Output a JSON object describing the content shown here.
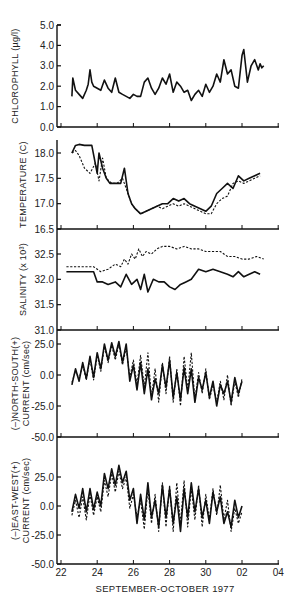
{
  "chart_data": {
    "type": "line",
    "xlabel": "SEPTEMBER-OCTOBER 1977",
    "x_tick_labels": [
      "22",
      "24",
      "26",
      "28",
      "30",
      "02",
      "04"
    ],
    "x_range_days": [
      0,
      12
    ],
    "panels": [
      {
        "id": "chlorophyll",
        "ylabel": "CHLOROPHYLL (µg/l)",
        "ylim": [
          0.0,
          5.0
        ],
        "y_ticks": [
          "5.0",
          "4.0",
          "3.0",
          "2.0",
          "1.0",
          "0.0"
        ],
        "series": [
          {
            "name": "chlorophyll",
            "style": "solid",
            "x": [
              0.6,
              0.65,
              0.8,
              1.0,
              1.2,
              1.4,
              1.5,
              1.6,
              1.7,
              1.8,
              2.0,
              2.2,
              2.4,
              2.6,
              2.8,
              3.0,
              3.2,
              3.4,
              3.6,
              3.8,
              4.0,
              4.2,
              4.4,
              4.6,
              4.8,
              5.0,
              5.2,
              5.4,
              5.6,
              5.8,
              6.0,
              6.2,
              6.4,
              6.6,
              6.8,
              7.0,
              7.2,
              7.4,
              7.6,
              7.8,
              8.0,
              8.2,
              8.4,
              8.6,
              8.8,
              9.0,
              9.2,
              9.4,
              9.6,
              9.8,
              10.0,
              10.1,
              10.3,
              10.5,
              10.7,
              10.9,
              11.0,
              11.1,
              11.2
            ],
            "values": [
              1.5,
              2.4,
              1.8,
              1.6,
              1.4,
              1.8,
              2.1,
              2.8,
              2.2,
              2.0,
              1.9,
              1.8,
              2.3,
              1.9,
              1.7,
              2.4,
              1.7,
              1.6,
              1.5,
              1.4,
              1.6,
              1.5,
              1.5,
              2.2,
              2.4,
              1.9,
              1.6,
              1.9,
              2.4,
              2.1,
              2.6,
              1.7,
              2.2,
              2.0,
              1.7,
              1.8,
              1.3,
              1.6,
              1.8,
              1.5,
              2.1,
              1.7,
              2.0,
              2.6,
              2.2,
              3.3,
              2.6,
              2.8,
              2.0,
              1.9,
              3.5,
              3.8,
              2.2,
              3.0,
              3.3,
              2.8,
              3.1,
              2.9,
              3.0
            ]
          }
        ]
      },
      {
        "id": "temperature",
        "ylabel": "TEMPERATURE (C)",
        "ylim": [
          16.5,
          18.25
        ],
        "y_ticks": [
          "18.0",
          "17.5",
          "17.0",
          "16.5"
        ],
        "series": [
          {
            "name": "temperature-solid",
            "style": "solid",
            "x": [
              0.6,
              0.8,
              1.0,
              1.3,
              1.7,
              2.0,
              2.1,
              2.3,
              2.5,
              2.7,
              3.0,
              3.3,
              3.5,
              3.7,
              3.9,
              4.1,
              4.4,
              4.7,
              5.0,
              5.3,
              5.6,
              5.9,
              6.2,
              6.5,
              6.8,
              7.1,
              7.4,
              7.7,
              8.0,
              8.3,
              8.6,
              8.9,
              9.2,
              9.5,
              9.8,
              10.1,
              10.4,
              10.7,
              11.0
            ],
            "values": [
              18.0,
              18.15,
              18.17,
              18.15,
              18.15,
              17.6,
              18.0,
              17.7,
              17.5,
              17.4,
              17.4,
              17.4,
              17.7,
              17.2,
              17.0,
              16.9,
              16.8,
              16.85,
              16.9,
              16.95,
              17.0,
              17.0,
              17.1,
              17.05,
              17.1,
              17.0,
              16.95,
              16.9,
              16.85,
              16.95,
              17.2,
              17.3,
              17.4,
              17.3,
              17.55,
              17.45,
              17.5,
              17.55,
              17.6
            ]
          },
          {
            "name": "temperature-dashed",
            "style": "dashed",
            "x": [
              0.6,
              0.8,
              1.0,
              1.3,
              1.6,
              1.9,
              2.1,
              2.3,
              2.5,
              2.8,
              3.1,
              3.4,
              3.7,
              3.9,
              4.1,
              4.4,
              4.7,
              5.0,
              5.3,
              5.6,
              5.9,
              6.2,
              6.5,
              6.8,
              7.1,
              7.4,
              7.7,
              8.0,
              8.3,
              8.6,
              8.9,
              9.2,
              9.5,
              9.8,
              10.1,
              10.4,
              10.7,
              11.0
            ],
            "values": [
              18.0,
              18.05,
              17.95,
              17.7,
              17.6,
              17.8,
              17.45,
              17.9,
              17.5,
              17.4,
              17.4,
              17.5,
              17.2,
              17.0,
              16.9,
              16.8,
              16.85,
              16.9,
              16.95,
              16.9,
              16.95,
              17.0,
              16.95,
              17.0,
              16.95,
              16.9,
              16.85,
              16.8,
              16.8,
              17.0,
              17.1,
              17.15,
              17.4,
              17.45,
              17.4,
              17.45,
              17.5,
              17.55
            ]
          }
        ]
      },
      {
        "id": "salinity",
        "ylabel": "SALINITY (x 10³)",
        "ylim": [
          31.0,
          32.75
        ],
        "y_ticks": [
          "32.5",
          "32.0",
          "31.5",
          "31.0"
        ],
        "series": [
          {
            "name": "salinity-dashed",
            "style": "dashed",
            "x": [
              0.3,
              0.8,
              1.3,
              1.8,
              2.2,
              2.6,
              3.0,
              3.3,
              3.5,
              3.7,
              3.9,
              4.1,
              4.3,
              4.5,
              4.7,
              5.0,
              5.3,
              5.6,
              6.0,
              6.4,
              6.8,
              7.2,
              7.6,
              8.0,
              8.4,
              8.8,
              9.2,
              9.6,
              10.0,
              10.4,
              10.8,
              11.2
            ],
            "values": [
              32.25,
              32.25,
              32.25,
              32.25,
              32.15,
              32.2,
              32.3,
              32.25,
              32.4,
              32.3,
              32.5,
              32.4,
              32.6,
              32.45,
              32.55,
              32.5,
              32.6,
              32.65,
              32.65,
              32.6,
              32.65,
              32.6,
              32.6,
              32.55,
              32.55,
              32.55,
              32.45,
              32.45,
              32.4,
              32.4,
              32.45,
              32.4
            ]
          },
          {
            "name": "salinity-solid",
            "style": "solid",
            "x": [
              0.3,
              0.8,
              1.3,
              1.8,
              2.0,
              2.3,
              2.6,
              3.0,
              3.3,
              3.6,
              3.9,
              4.2,
              4.4,
              4.6,
              4.8,
              5.1,
              5.4,
              5.7,
              6.0,
              6.3,
              6.6,
              6.9,
              7.2,
              7.6,
              8.0,
              8.4,
              8.8,
              9.2,
              9.5,
              9.8,
              10.1,
              10.4,
              10.7,
              11.0
            ],
            "values": [
              32.15,
              32.15,
              32.15,
              32.15,
              31.95,
              31.95,
              31.9,
              31.95,
              31.85,
              32.1,
              31.9,
              32.0,
              31.8,
              32.1,
              31.75,
              32.0,
              31.95,
              31.95,
              31.85,
              31.8,
              31.9,
              31.95,
              32.0,
              32.2,
              32.15,
              32.2,
              32.15,
              32.1,
              32.05,
              32.15,
              32.05,
              32.1,
              32.15,
              32.1
            ]
          }
        ]
      },
      {
        "id": "north-south-current",
        "ylabel": "(–)NORTH-SOUTH(+) CURRENT (cm/sec)",
        "ylim": [
          -50.0,
          25.0
        ],
        "y_ticks": [
          "25.0",
          "0.0",
          "-25.0",
          "-50.0"
        ],
        "series": [
          {
            "name": "ns-current-solid",
            "style": "solid",
            "x": [
              0.6,
              0.8,
              1.0,
              1.2,
              1.4,
              1.6,
              1.8,
              2.0,
              2.2,
              2.4,
              2.6,
              2.8,
              3.0,
              3.2,
              3.4,
              3.6,
              3.8,
              4.0,
              4.2,
              4.4,
              4.6,
              4.8,
              5.0,
              5.2,
              5.4,
              5.6,
              5.8,
              6.0,
              6.2,
              6.4,
              6.6,
              6.8,
              7.0,
              7.2,
              7.4,
              7.6,
              7.8,
              8.0,
              8.2,
              8.4,
              8.6,
              8.8,
              9.0,
              9.2,
              9.4,
              9.6,
              9.8,
              10.0
            ],
            "values": [
              -8,
              5,
              -5,
              10,
              -3,
              15,
              -2,
              18,
              5,
              25,
              12,
              26,
              15,
              27,
              10,
              25,
              -5,
              8,
              -12,
              10,
              -15,
              5,
              -20,
              -3,
              -15,
              8,
              -10,
              12,
              -18,
              2,
              -20,
              6,
              -15,
              5,
              -22,
              -2,
              -12,
              2,
              -18,
              -5,
              -25,
              -8,
              -15,
              -5,
              -22,
              -2,
              -15,
              -5
            ]
          },
          {
            "name": "ns-current-dashed",
            "style": "dashed",
            "x": [
              0.6,
              0.8,
              1.0,
              1.2,
              1.4,
              1.6,
              1.8,
              2.0,
              2.2,
              2.4,
              2.6,
              2.8,
              3.0,
              3.2,
              3.4,
              3.6,
              3.8,
              4.0,
              4.2,
              4.4,
              4.6,
              4.8,
              5.0,
              5.2,
              5.4,
              5.6,
              5.8,
              6.0,
              6.2,
              6.4,
              6.6,
              6.8,
              7.0,
              7.2,
              7.4,
              7.6,
              7.8,
              8.0,
              8.2,
              8.4,
              8.6,
              8.8,
              9.0,
              9.2,
              9.4,
              9.6,
              9.8,
              10.0
            ],
            "values": [
              -6,
              3,
              -3,
              8,
              -4,
              13,
              -4,
              16,
              3,
              23,
              10,
              24,
              12,
              25,
              8,
              22,
              -2,
              12,
              -8,
              16,
              -10,
              18,
              -18,
              5,
              -22,
              10,
              -15,
              15,
              -22,
              5,
              -25,
              15,
              -12,
              18,
              -20,
              2,
              -15,
              5,
              -20,
              -8,
              -22,
              -5,
              -20,
              0,
              -25,
              -5,
              -18,
              -3
            ]
          }
        ]
      },
      {
        "id": "east-west-current",
        "ylabel": "(–)EAST-WEST(+) CURRENT (cm/sec)",
        "ylim": [
          -50.0,
          35.0
        ],
        "y_ticks": [
          "25.0",
          "0.0",
          "-25.0",
          "-50.0"
        ],
        "series": [
          {
            "name": "ew-current-solid",
            "style": "solid",
            "x": [
              0.6,
              0.8,
              1.0,
              1.2,
              1.4,
              1.6,
              1.8,
              2.0,
              2.2,
              2.4,
              2.6,
              2.8,
              3.0,
              3.2,
              3.4,
              3.6,
              3.8,
              4.0,
              4.2,
              4.4,
              4.6,
              4.8,
              5.0,
              5.2,
              5.4,
              5.6,
              5.8,
              6.0,
              6.2,
              6.4,
              6.6,
              6.8,
              7.0,
              7.2,
              7.4,
              7.6,
              7.8,
              8.0,
              8.2,
              8.4,
              8.6,
              8.8,
              9.0,
              9.2,
              9.4,
              9.6,
              9.8,
              10.0
            ],
            "values": [
              -5,
              10,
              -2,
              15,
              -5,
              15,
              -3,
              12,
              0,
              28,
              15,
              32,
              18,
              35,
              20,
              30,
              5,
              15,
              -15,
              10,
              -12,
              20,
              -10,
              5,
              -18,
              18,
              -10,
              15,
              -15,
              8,
              -22,
              15,
              -10,
              20,
              -5,
              15,
              -10,
              5,
              -15,
              12,
              -5,
              8,
              -15,
              -5,
              -18,
              5,
              -10,
              0
            ]
          },
          {
            "name": "ew-current-dashed",
            "style": "dashed",
            "x": [
              0.6,
              0.8,
              1.0,
              1.2,
              1.4,
              1.6,
              1.8,
              2.0,
              2.2,
              2.4,
              2.6,
              2.8,
              3.0,
              3.2,
              3.4,
              3.6,
              3.8,
              4.0,
              4.2,
              4.4,
              4.6,
              4.8,
              5.0,
              5.2,
              5.4,
              5.6,
              5.8,
              6.0,
              6.2,
              6.4,
              6.6,
              6.8,
              7.0,
              7.2,
              7.4,
              7.6,
              7.8,
              8.0,
              8.2,
              8.4,
              8.6,
              8.8,
              9.0,
              9.2,
              9.4,
              9.6,
              9.8,
              10.0
            ],
            "values": [
              -8,
              5,
              -10,
              8,
              -12,
              10,
              -8,
              8,
              -5,
              22,
              8,
              28,
              12,
              30,
              15,
              25,
              -2,
              10,
              -10,
              5,
              -20,
              15,
              -15,
              10,
              -22,
              20,
              -18,
              18,
              -22,
              20,
              -15,
              22,
              -18,
              15,
              -12,
              18,
              -18,
              10,
              -12,
              15,
              -8,
              18,
              -12,
              5,
              -22,
              -2,
              -15,
              -5
            ]
          }
        ]
      }
    ]
  },
  "labels": {
    "xlabel": "SEPTEMBER-OCTOBER 1977",
    "x_ticks": [
      "22",
      "24",
      "26",
      "28",
      "30",
      "02",
      "04"
    ],
    "p1_ylabel": "CHLOROPHYLL (µg/l)",
    "p2_ylabel": "TEMPERATURE (C)",
    "p3_ylabel": "SALINITY (x 10³)",
    "p4_ylabel_a": "(–)NORTH-SOUTH(+)",
    "p4_ylabel_b": "CURRENT (cm/sec)",
    "p5_ylabel_a": "(–)EAST-WEST(+)",
    "p5_ylabel_b": "CURRENT (cm/sec)"
  }
}
